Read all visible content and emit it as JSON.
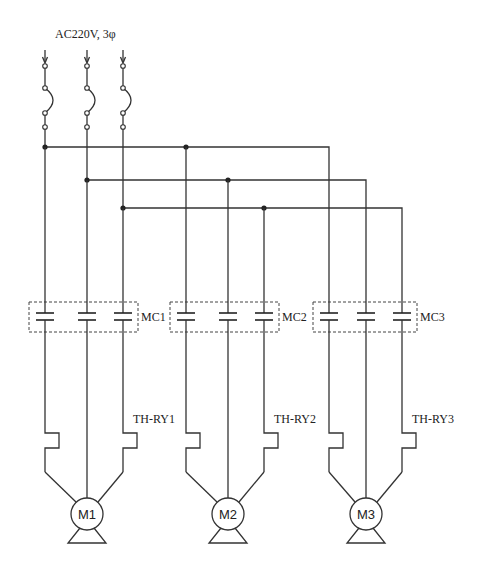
{
  "title": "AC220V, 3φ",
  "supply": {
    "voltage_label": "AC220V, 3φ",
    "phases": [
      "L1",
      "L2",
      "L3"
    ],
    "input_arrow_icon": "arrow-down-icon",
    "fuse_icon": "fuse-arc-icon"
  },
  "circuits": [
    {
      "contactor": "MC1",
      "thermal_relay": "TH-RY1",
      "motor": "M1"
    },
    {
      "contactor": "MC2",
      "thermal_relay": "TH-RY2",
      "motor": "M2"
    },
    {
      "contactor": "MC3",
      "thermal_relay": "TH-RY3",
      "motor": "M3"
    }
  ],
  "colors": {
    "line": "#333333",
    "background": "#ffffff"
  }
}
